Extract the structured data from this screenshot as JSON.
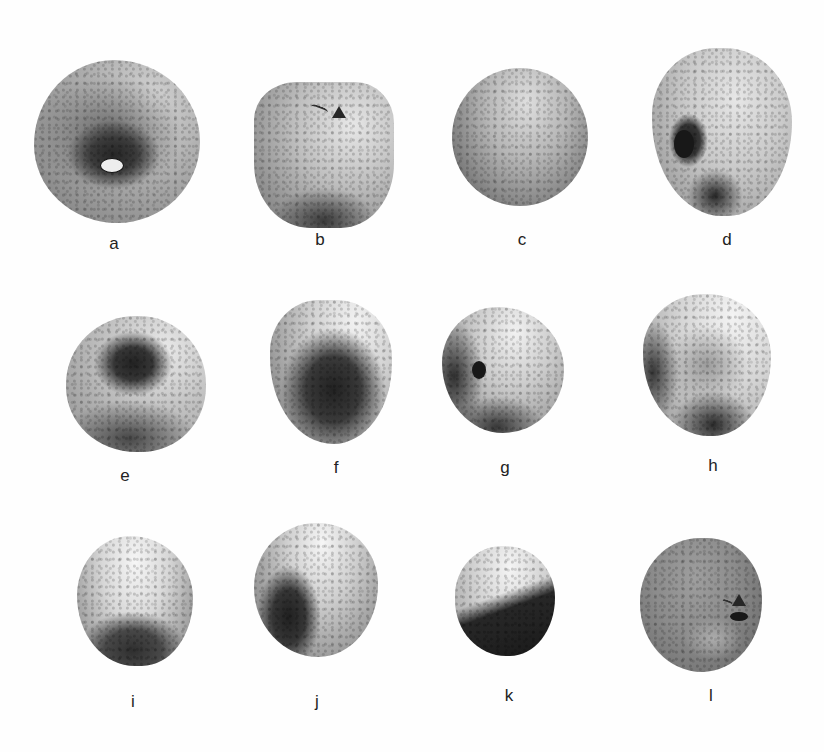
{
  "figure": {
    "background_color": "#ffffff",
    "items": [
      {
        "label": "a",
        "markings": [
          "catalogue number in oval"
        ]
      },
      {
        "label": "b",
        "markings": [
          "handwritten mark",
          "triangle symbol"
        ]
      },
      {
        "label": "c",
        "markings": []
      },
      {
        "label": "d",
        "markings": [
          "catalogue number in oval"
        ]
      },
      {
        "label": "e",
        "markings": []
      },
      {
        "label": "f",
        "markings": []
      },
      {
        "label": "g",
        "markings": [
          "catalogue number in oval"
        ]
      },
      {
        "label": "h",
        "markings": []
      },
      {
        "label": "i",
        "markings": []
      },
      {
        "label": "j",
        "markings": []
      },
      {
        "label": "k",
        "markings": []
      },
      {
        "label": "l",
        "markings": [
          "handwritten mark",
          "triangle symbol",
          "catalogue number in oval"
        ]
      }
    ]
  }
}
